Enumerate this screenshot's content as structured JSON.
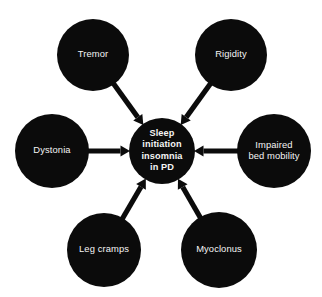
{
  "figure": {
    "type": "hub-and-spoke-diagram",
    "background_color": "#ffffff",
    "node_color": "#0b0b0b",
    "node_text_color": "#f4f4f4",
    "arrow_color": "#0b0b0b",
    "arrow_direction": "peripheral-nodes-point-to-center"
  },
  "center_node": {
    "id": "sleep-initiation-insomnia-in-pd",
    "lines": [
      "Sleep",
      "initiation",
      "insomnia",
      "in PD"
    ],
    "full_text": "Sleep initiation insomnia in PD",
    "cx": 162,
    "cy": 151,
    "r": 33
  },
  "peripheral_nodes": [
    {
      "id": "tremor",
      "lines": [
        "Tremor"
      ],
      "full_text": "Tremor",
      "cx": 93,
      "cy": 55,
      "r": 36,
      "position": "top-left"
    },
    {
      "id": "rigidity",
      "lines": [
        "Rigidity"
      ],
      "full_text": "Rigidity",
      "cx": 231,
      "cy": 55,
      "r": 36,
      "position": "top-right"
    },
    {
      "id": "dystonia",
      "lines": [
        "Dystonia"
      ],
      "full_text": "Dystonia",
      "cx": 52,
      "cy": 151,
      "r": 37,
      "position": "left"
    },
    {
      "id": "impaired-bed-mobility",
      "lines": [
        "Impaired",
        "bed mobility"
      ],
      "full_text": "Impaired bed mobility",
      "cx": 274,
      "cy": 151,
      "r": 37,
      "position": "right"
    },
    {
      "id": "leg-cramps",
      "lines": [
        "Leg cramps"
      ],
      "full_text": "Leg cramps",
      "cx": 104,
      "cy": 250,
      "r": 37,
      "position": "bottom-left"
    },
    {
      "id": "myoclonus",
      "lines": [
        "Myoclonus"
      ],
      "full_text": "Myoclonus",
      "cx": 219,
      "cy": 250,
      "r": 38,
      "position": "bottom-right"
    }
  ],
  "connectors": [
    {
      "id": "tremor-to-center",
      "from": "tremor",
      "to": "sleep-initiation-insomnia-in-pd"
    },
    {
      "id": "rigidity-to-center",
      "from": "rigidity",
      "to": "sleep-initiation-insomnia-in-pd"
    },
    {
      "id": "dystonia-to-center",
      "from": "dystonia",
      "to": "sleep-initiation-insomnia-in-pd"
    },
    {
      "id": "impaired-bed-mobility-to-center",
      "from": "impaired-bed-mobility",
      "to": "sleep-initiation-insomnia-in-pd"
    },
    {
      "id": "leg-cramps-to-center",
      "from": "leg-cramps",
      "to": "sleep-initiation-insomnia-in-pd"
    },
    {
      "id": "myoclonus-to-center",
      "from": "myoclonus",
      "to": "sleep-initiation-insomnia-in-pd"
    }
  ]
}
